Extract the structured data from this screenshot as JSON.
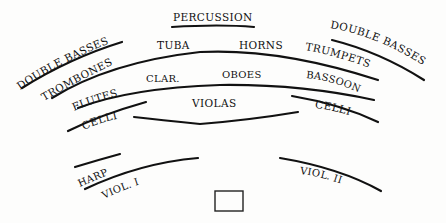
{
  "diagram": {
    "title": "",
    "type": "orchestra-seating",
    "sections": {
      "percussion": "PERCUSSION",
      "double_basses_left": "DOUBLE BASSES",
      "double_basses_right": "DOUBLE BASSES",
      "tuba": "TUBA",
      "horns": "HORNS",
      "trombones": "TROMBONES",
      "trumpets": "TRUMPETS",
      "flutes": "FLUTES",
      "clarinets": "CLAR.",
      "oboes": "OBOES",
      "bassoons": "BASSOONS",
      "violas": "VIOLAS",
      "celli_left": "CELLI",
      "celli_right": "CELLI",
      "harp": "HARP",
      "violins_1": "VIOL. I",
      "violins_2": "VIOL. II"
    },
    "conductor": "podium"
  }
}
